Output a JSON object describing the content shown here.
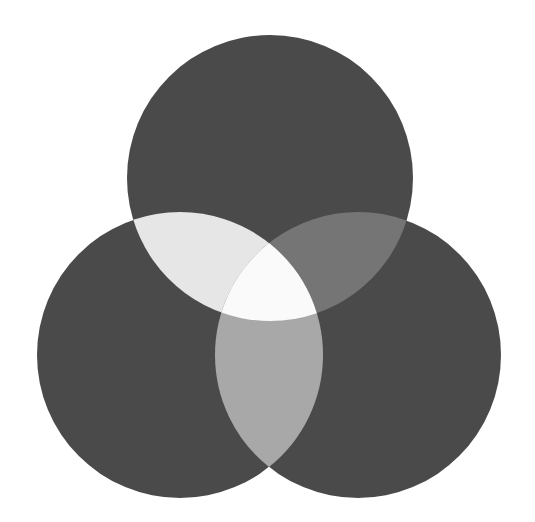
{
  "page": {
    "width": 535,
    "height": 522,
    "background_color": "#ffffff"
  },
  "chart_data": {
    "type": "venn",
    "title": "",
    "subtitle": "",
    "xlabel": "",
    "ylabel": "",
    "legend_position": "none",
    "grid": false,
    "axis_visible": false,
    "labels_visible": false,
    "set_count": 3,
    "canvas": {
      "width": 535,
      "height": 522
    },
    "sets": [
      {
        "id": "A",
        "name": "top-circle",
        "label": "",
        "cx": 270,
        "cy": 178,
        "r": 143,
        "fill": "#4a4a4a"
      },
      {
        "id": "B",
        "name": "bottom-left-circle",
        "label": "",
        "cx": 180,
        "cy": 355,
        "r": 143,
        "fill": "#4a4a4a"
      },
      {
        "id": "C",
        "name": "bottom-right-circle",
        "label": "",
        "cx": 358,
        "cy": 355,
        "r": 143,
        "fill": "#4a4a4a"
      }
    ],
    "regions": [
      {
        "id": "A",
        "name": "top-only",
        "sets": [
          "A"
        ],
        "fill": "#4a4a4a",
        "value": null,
        "label": ""
      },
      {
        "id": "B",
        "name": "bottom-left-only",
        "sets": [
          "B"
        ],
        "fill": "#4a4a4a",
        "value": null,
        "label": ""
      },
      {
        "id": "C",
        "name": "bottom-right-only",
        "sets": [
          "C"
        ],
        "fill": "#4a4a4a",
        "value": null,
        "label": ""
      },
      {
        "id": "AB",
        "name": "top-and-bottom-left",
        "sets": [
          "A",
          "B"
        ],
        "fill": "#e6e6e6",
        "value": null,
        "label": ""
      },
      {
        "id": "AC",
        "name": "top-and-bottom-right",
        "sets": [
          "A",
          "C"
        ],
        "fill": "#757575",
        "value": null,
        "label": ""
      },
      {
        "id": "BC",
        "name": "bottom-left-and-right",
        "sets": [
          "B",
          "C"
        ],
        "fill": "#a8a8a8",
        "value": null,
        "label": ""
      },
      {
        "id": "ABC",
        "name": "all-three",
        "sets": [
          "A",
          "B",
          "C"
        ],
        "fill": "#fafafa",
        "value": null,
        "label": ""
      }
    ],
    "colors": {
      "background": "#ffffff",
      "circle_base": "#4a4a4a",
      "overlap_top_left": "#e6e6e6",
      "overlap_top_right": "#757575",
      "overlap_bottom": "#a8a8a8",
      "overlap_center": "#fafafa"
    }
  }
}
